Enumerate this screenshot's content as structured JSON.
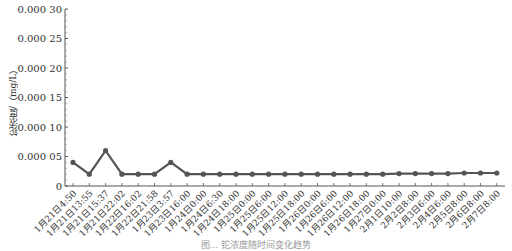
{
  "chart_data": {
    "type": "line",
    "title": "",
    "xlabel": "",
    "ylabel": "铊浓度/（mg/L）",
    "ylim": [
      0,
      0.0003
    ],
    "yticks": [
      "0",
      "0.000 05",
      "0.000 10",
      "0.000 15",
      "0.000 20",
      "0.000 25",
      "0.000 30"
    ],
    "grid": false,
    "legend": null,
    "categories": [
      "1月21日4:50",
      "1月21日13:55",
      "1月21日15:37",
      "1月21日22:02",
      "1月22日16:02",
      "1月22日21:58",
      "1月23日3:57",
      "1月23日16:00",
      "1月24日0:00",
      "1月24日6:30",
      "1月24日18:00",
      "1月25日0:00",
      "1月25日6:00",
      "1月25日12:00",
      "1月25日18:00",
      "1月26日0:00",
      "1月26日6:00",
      "1月26日12:00",
      "1月26日18:00",
      "1月27日0:00",
      "2月1日10:00",
      "2月2日8:00",
      "2月3日6:00",
      "2月4日6:00",
      "2月5日8:00",
      "2月6日8:00",
      "2月7日8:00"
    ],
    "series": [
      {
        "name": "铊浓度",
        "color": "#555555",
        "values": [
          4e-05,
          2e-05,
          6e-05,
          2e-05,
          2e-05,
          2e-05,
          4e-05,
          2e-05,
          2e-05,
          2e-05,
          2e-05,
          2e-05,
          2e-05,
          2e-05,
          2e-05,
          2e-05,
          2e-05,
          2e-05,
          2e-05,
          2e-05,
          2.1e-05,
          2.1e-05,
          2.1e-05,
          2.1e-05,
          2.2e-05,
          2.2e-05,
          2.2e-05
        ]
      }
    ]
  },
  "caption": "图… 铊浓度随时间变化趋势"
}
